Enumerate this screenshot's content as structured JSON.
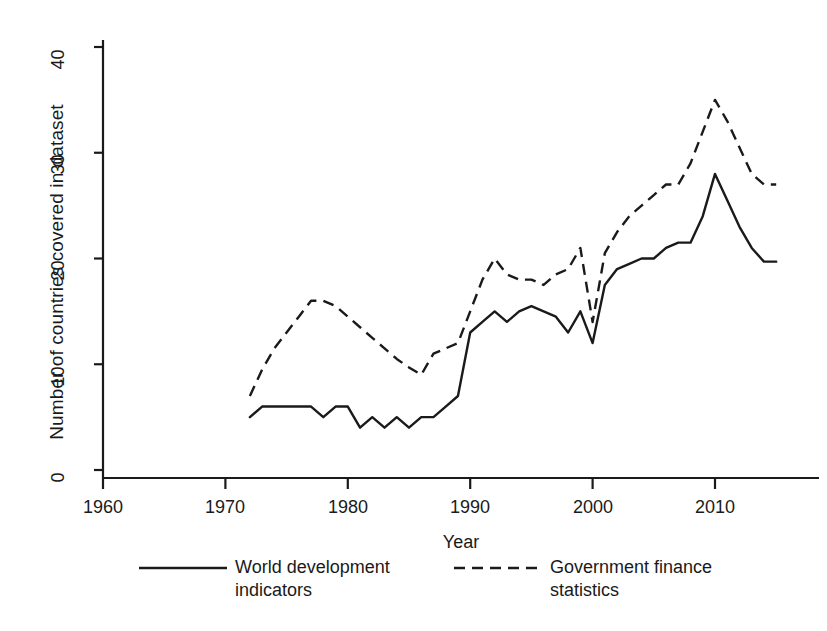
{
  "chart_data": {
    "type": "line",
    "title": "",
    "xlabel": "Year",
    "ylabel": "Number of countries covered in dataset",
    "xlim": [
      1958,
      1917.5
    ],
    "x_axis": {
      "min": 1958,
      "max": 2018,
      "ticks": [
        1960,
        1970,
        1980,
        1990,
        2000,
        2010
      ]
    },
    "y_axis": {
      "min": 0,
      "max": 42,
      "ticks": [
        0,
        10,
        20,
        30,
        40
      ]
    },
    "grid": false,
    "legend_position": "bottom",
    "series": [
      {
        "name": "World development indicators",
        "style": "solid",
        "color": "#1a1a1a",
        "x": [
          1972,
          1973,
          1974,
          1975,
          1976,
          1977,
          1978,
          1979,
          1980,
          1981,
          1982,
          1983,
          1984,
          1985,
          1986,
          1987,
          1988,
          1989,
          1990,
          1991,
          1992,
          1993,
          1994,
          1995,
          1996,
          1997,
          1998,
          1999,
          2000,
          2001,
          2002,
          2003,
          2004,
          2005,
          2006,
          2007,
          2008,
          2009,
          2010,
          2011,
          2012,
          2013,
          2014,
          2015
        ],
        "values": [
          5,
          6,
          6,
          6,
          6,
          6,
          5,
          6,
          6,
          4,
          5,
          4,
          5,
          4,
          5,
          5,
          6,
          7,
          13,
          14,
          15,
          14,
          15,
          15.5,
          15,
          14.5,
          13,
          15,
          12,
          17.5,
          19,
          19.5,
          20,
          20,
          21,
          21.5,
          21.5,
          24,
          28,
          25.5,
          23,
          21,
          19.7,
          19.7
        ]
      },
      {
        "name": "Government finance statistics",
        "style": "dashed",
        "color": "#1a1a1a",
        "x": [
          1972,
          1973,
          1974,
          1975,
          1976,
          1977,
          1978,
          1979,
          1980,
          1981,
          1982,
          1983,
          1984,
          1985,
          1986,
          1987,
          1988,
          1989,
          1990,
          1991,
          1992,
          1993,
          1994,
          1995,
          1996,
          1997,
          1998,
          1999,
          2000,
          2001,
          2002,
          2003,
          2004,
          2005,
          2006,
          2007,
          2008,
          2009,
          2010,
          2011,
          2012,
          2013,
          2014,
          2015
        ],
        "values": [
          7,
          9.5,
          11.5,
          13,
          14.5,
          16,
          16,
          15.5,
          14.5,
          13.5,
          12.5,
          11.5,
          10.5,
          9.7,
          9,
          11,
          11.5,
          12,
          15,
          18,
          20,
          18.5,
          18,
          18,
          17.5,
          18.5,
          19,
          21,
          14,
          20.5,
          22.5,
          24,
          25,
          26,
          27,
          27,
          29,
          32,
          35,
          33,
          30.5,
          28,
          27,
          27
        ]
      }
    ]
  },
  "axes": {
    "y_tick_labels": [
      "0",
      "10",
      "20",
      "30",
      "40"
    ],
    "x_tick_labels": [
      "1960",
      "1970",
      "1980",
      "1990",
      "2000",
      "2010"
    ],
    "y_title": "Number of countries covered in dataset",
    "x_title": "Year"
  },
  "legend": {
    "entries": [
      {
        "label": "World development\nindicators",
        "style": "solid"
      },
      {
        "label": "Government finance\nstatistics",
        "style": "dashed"
      }
    ]
  }
}
